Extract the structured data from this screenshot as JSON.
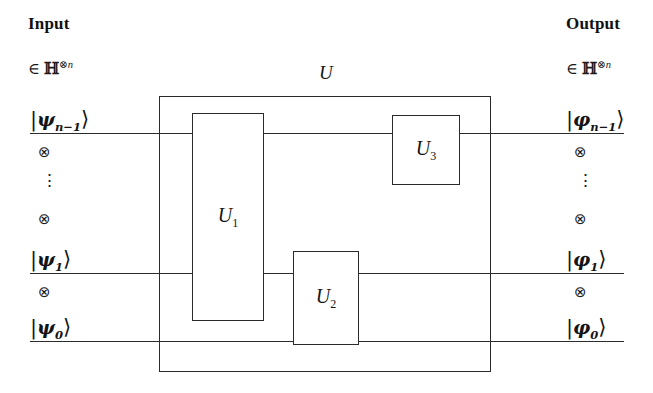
{
  "figure": {
    "type": "quantum-circuit-diagram",
    "background_color": "#ffffff",
    "line_color": "#2b2b2b",
    "text_color": "#141414"
  },
  "input": {
    "heading": "Input",
    "space_prefix": "∈",
    "space_symbol": "ℍ",
    "space_superscript_otimes": "⊗",
    "space_superscript_n": "n",
    "kets": [
      {
        "bar": "|",
        "symbol": "ψ",
        "sub": "n−1",
        "angle": "⟩"
      },
      {
        "bar": "|",
        "symbol": "ψ",
        "sub": "1",
        "angle": "⟩"
      },
      {
        "bar": "|",
        "symbol": "ψ",
        "sub": "0",
        "angle": "⟩"
      }
    ],
    "separators": [
      {
        "kind": "otimes",
        "glyph": "⊗"
      },
      {
        "kind": "vdots",
        "glyph": "⋮"
      },
      {
        "kind": "otimes",
        "glyph": "⊗"
      },
      {
        "kind": "otimes",
        "glyph": "⊗"
      }
    ]
  },
  "output": {
    "heading": "Output",
    "space_prefix": "∈",
    "space_symbol": "ℍ",
    "space_superscript_otimes": "⊗",
    "space_superscript_n": "n",
    "kets": [
      {
        "bar": "|",
        "symbol": "φ",
        "sub": "n−1",
        "angle": "⟩"
      },
      {
        "bar": "|",
        "symbol": "φ",
        "sub": "1",
        "angle": "⟩"
      },
      {
        "bar": "|",
        "symbol": "φ",
        "sub": "0",
        "angle": "⟩"
      }
    ],
    "separators": [
      {
        "kind": "otimes",
        "glyph": "⊗"
      },
      {
        "kind": "vdots",
        "glyph": "⋮"
      },
      {
        "kind": "otimes",
        "glyph": "⊗"
      },
      {
        "kind": "otimes",
        "glyph": "⊗"
      }
    ]
  },
  "circuit": {
    "outer_gate_label": "U",
    "gates": [
      {
        "label_base": "U",
        "label_sub": "1",
        "name": "gate-u1"
      },
      {
        "label_base": "U",
        "label_sub": "2",
        "name": "gate-u2"
      },
      {
        "label_base": "U",
        "label_sub": "3",
        "name": "gate-u3"
      }
    ],
    "wire_count_shown": 3
  }
}
